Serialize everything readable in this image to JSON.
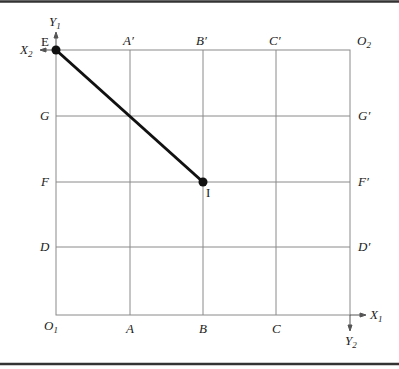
{
  "diagram": {
    "type": "edgeworth-box-grid",
    "colors": {
      "grid": "#8a8a8a",
      "line": "#111111",
      "border": "#333333",
      "background": "#ffffff"
    },
    "top_labels": [
      "A′",
      "B′",
      "C′"
    ],
    "bottom_labels": [
      "A",
      "B",
      "C"
    ],
    "left_labels": [
      "G",
      "F",
      "D"
    ],
    "right_labels": [
      "G′",
      "F′",
      "D′"
    ],
    "corners": {
      "origin1": {
        "base": "O",
        "sub": "1"
      },
      "origin2": {
        "base": "O",
        "sub": "2"
      }
    },
    "axes": {
      "x1": {
        "base": "X",
        "sub": "1"
      },
      "y1": {
        "base": "Y",
        "sub": "1"
      },
      "x2": {
        "base": "X",
        "sub": "2"
      },
      "y2": {
        "base": "Y",
        "sub": "2"
      }
    },
    "points": {
      "E": {
        "label": "E"
      },
      "I": {
        "label": "I"
      }
    }
  }
}
